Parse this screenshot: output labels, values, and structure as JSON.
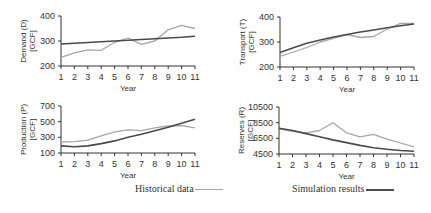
{
  "chart_data": [
    {
      "type": "line",
      "ylabel": "Demand (D) [GCF]",
      "xlabel": "Year",
      "x": [
        1,
        2,
        3,
        4,
        5,
        6,
        7,
        8,
        9,
        10,
        11
      ],
      "ylim": [
        200,
        400
      ],
      "yticks": [
        200,
        300,
        400
      ],
      "series": [
        {
          "name": "Historical data",
          "values": [
            235,
            253,
            265,
            263,
            295,
            312,
            287,
            300,
            345,
            363,
            350
          ]
        },
        {
          "name": "Simulation results",
          "values": [
            288,
            291,
            294,
            297,
            300,
            303,
            306,
            309,
            312,
            315,
            319
          ]
        }
      ]
    },
    {
      "type": "line",
      "ylabel": "Transport (T) [GCF]",
      "xlabel": "Year",
      "x": [
        1,
        2,
        3,
        4,
        5,
        6,
        7,
        8,
        9,
        10,
        11
      ],
      "ylim": [
        200,
        400
      ],
      "yticks": [
        200,
        300,
        400
      ],
      "series": [
        {
          "name": "Historical data",
          "values": [
            242,
            260,
            278,
            300,
            315,
            330,
            318,
            322,
            352,
            375,
            374
          ]
        },
        {
          "name": "Simulation results",
          "values": [
            258,
            277,
            295,
            308,
            320,
            330,
            340,
            348,
            357,
            365,
            372
          ]
        }
      ]
    },
    {
      "type": "line",
      "ylabel": "Production (P) [GCF]",
      "xlabel": "Year",
      "x": [
        1,
        2,
        3,
        4,
        5,
        6,
        7,
        8,
        9,
        10,
        11
      ],
      "ylim": [
        100,
        700
      ],
      "yticks": [
        100,
        300,
        500,
        700
      ],
      "series": [
        {
          "name": "Historical data",
          "values": [
            240,
            245,
            265,
            320,
            370,
            395,
            385,
            420,
            445,
            450,
            420
          ]
        },
        {
          "name": "Simulation results",
          "values": [
            190,
            180,
            190,
            220,
            255,
            300,
            340,
            385,
            430,
            480,
            530
          ]
        }
      ]
    },
    {
      "type": "line",
      "ylabel": "Reserves (R) [GCF]",
      "xlabel": "Year",
      "x": [
        1,
        2,
        3,
        4,
        5,
        6,
        7,
        8,
        9,
        10,
        11
      ],
      "ylim": [
        4500,
        10500
      ],
      "yticks": [
        4500,
        6500,
        8500,
        10500
      ],
      "series": [
        {
          "name": "Historical data",
          "values": [
            7700,
            7400,
            7200,
            7500,
            8500,
            7200,
            6700,
            7000,
            6400,
            5900,
            5400
          ]
        },
        {
          "name": "Simulation results",
          "values": [
            7800,
            7500,
            7100,
            6700,
            6300,
            5950,
            5600,
            5300,
            5100,
            4950,
            4850
          ]
        }
      ]
    }
  ],
  "legend": {
    "historical": "Historical data",
    "simulation": "Simulation results"
  },
  "colors": {
    "historical": "#a6a6a6",
    "simulation": "#4a4a4a",
    "axis": "#333333"
  }
}
